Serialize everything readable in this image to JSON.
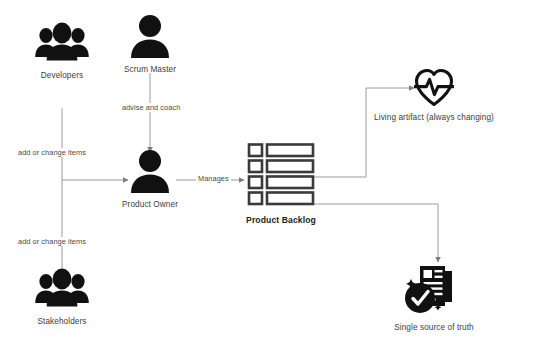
{
  "diagram": {
    "background": "#ffffff",
    "line_color": "#8c8c8c",
    "icon_color": "#141414",
    "nodes": [
      {
        "id": "developers",
        "label": "Developers",
        "icon": "people-group-icon",
        "x": 62,
        "y": 60
      },
      {
        "id": "scrum-master",
        "label": "Scrum Master",
        "icon": "person-icon",
        "x": 150,
        "y": 40
      },
      {
        "id": "product-owner",
        "label": "Product Owner",
        "icon": "person-icon",
        "x": 150,
        "y": 175
      },
      {
        "id": "stakeholders",
        "label": "Stakeholders",
        "icon": "people-group-icon",
        "x": 62,
        "y": 295
      },
      {
        "id": "product-backlog",
        "label": "Product Backlog",
        "icon": "backlog-list-icon",
        "x": 281,
        "y": 175,
        "bold": true
      },
      {
        "id": "living-artifact",
        "label": "Living artifact (always changing)",
        "icon": "heartbeat-icon",
        "x": 434,
        "y": 90
      },
      {
        "id": "single-source",
        "label": "Single source of truth",
        "icon": "document-check-icon",
        "x": 434,
        "y": 290
      }
    ],
    "edges": [
      {
        "id": "developers-to-po",
        "from": "developers",
        "to": "product-owner",
        "label": "add or change items"
      },
      {
        "id": "scrum-master-to-po",
        "from": "scrum-master",
        "to": "product-owner",
        "label": "advise and coach"
      },
      {
        "id": "stakeholders-to-po",
        "from": "stakeholders",
        "to": "product-owner",
        "label": "add or change items"
      },
      {
        "id": "po-to-backlog",
        "from": "product-owner",
        "to": "product-backlog",
        "label": "Manages"
      },
      {
        "id": "backlog-to-living-artifact",
        "from": "product-backlog",
        "to": "living-artifact",
        "label": ""
      },
      {
        "id": "backlog-to-single-source",
        "from": "product-backlog",
        "to": "single-source",
        "label": ""
      }
    ]
  }
}
